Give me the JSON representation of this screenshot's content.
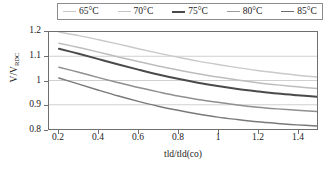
{
  "chart_data": {
    "type": "line",
    "title": "",
    "xlabel": "tld/tld(co)",
    "ylabel": "V/V_RDC",
    "ylabel_main": "V/V",
    "ylabel_sub": "RDC",
    "xlim": [
      0.15,
      1.5
    ],
    "ylim": [
      0.8,
      1.2
    ],
    "xticks": [
      "0.2",
      "0.4",
      "0.6",
      "0.8",
      "1",
      "1.2",
      "1.4"
    ],
    "xtick_values": [
      0.2,
      0.4,
      0.6,
      0.8,
      1.0,
      1.2,
      1.4
    ],
    "yticks": [
      "0.8",
      "0.9",
      "1",
      "1.1",
      "1.2"
    ],
    "ytick_values": [
      0.8,
      0.9,
      1.0,
      1.1,
      1.2
    ],
    "grid": true,
    "grid_axis": "y",
    "legend_position": "top",
    "x": [
      0.2,
      0.3,
      0.4,
      0.5,
      0.6,
      0.7,
      0.8,
      0.9,
      1.0,
      1.1,
      1.2,
      1.3,
      1.4,
      1.5
    ],
    "series": [
      {
        "name": "65°C",
        "color": "#c9c9c9",
        "width": 1.5,
        "values": [
          1.2,
          1.185,
          1.168,
          1.15,
          1.131,
          1.113,
          1.096,
          1.08,
          1.066,
          1.053,
          1.041,
          1.031,
          1.022,
          1.014
        ]
      },
      {
        "name": "70°C",
        "color": "#bdbdbd",
        "width": 1.5,
        "values": [
          1.154,
          1.136,
          1.117,
          1.097,
          1.078,
          1.06,
          1.043,
          1.028,
          1.014,
          1.002,
          0.991,
          0.982,
          0.974,
          0.967
        ]
      },
      {
        "name": "75°C",
        "color": "#4a4a4a",
        "width": 2.0,
        "values": [
          1.131,
          1.11,
          1.088,
          1.066,
          1.045,
          1.025,
          1.007,
          0.991,
          0.977,
          0.965,
          0.955,
          0.946,
          0.939,
          0.933
        ]
      },
      {
        "name": "80°C",
        "color": "#8f8f8f",
        "width": 1.5,
        "values": [
          1.055,
          1.034,
          1.012,
          0.991,
          0.971,
          0.953,
          0.936,
          0.922,
          0.91,
          0.899,
          0.89,
          0.883,
          0.877,
          0.872
        ]
      },
      {
        "name": "85°C",
        "color": "#7a7a7a",
        "width": 1.5,
        "values": [
          1.01,
          0.985,
          0.96,
          0.936,
          0.914,
          0.894,
          0.877,
          0.862,
          0.849,
          0.839,
          0.83,
          0.823,
          0.817,
          0.812
        ]
      }
    ]
  },
  "legend": {
    "items": [
      {
        "label": "65°C",
        "color": "#c9c9c9",
        "width": 1.5
      },
      {
        "label": "70°C",
        "color": "#c4c4c4",
        "width": 1.5
      },
      {
        "label": "75°C",
        "color": "#4a4a4a",
        "width": 2.0
      },
      {
        "label": "80°C",
        "color": "#9a9a9a",
        "width": 1.5
      },
      {
        "label": "85°C",
        "color": "#6e6e6e",
        "width": 1.8
      }
    ]
  },
  "style": {
    "axis_color": "#6f6f6f",
    "grid_color": "#cfcfcf",
    "legend_border": "#8c8c8c",
    "text_color": "#1a1a1a",
    "background": "#ffffff"
  }
}
